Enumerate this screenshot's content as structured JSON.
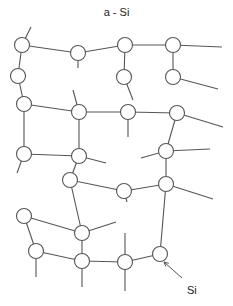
{
  "title": "a - Si",
  "annotation": {
    "label": "Si",
    "x": 187,
    "y": 284,
    "arrow_from": [
      182,
      278
    ],
    "arrow_to": [
      164,
      262
    ]
  },
  "style": {
    "stroke": "#555555",
    "node_fill": "#ffffff",
    "node_radius": 7.5
  },
  "nodes": [
    {
      "id": 1,
      "x": 22,
      "y": 45
    },
    {
      "id": 2,
      "x": 78,
      "y": 53
    },
    {
      "id": 3,
      "x": 125,
      "y": 45
    },
    {
      "id": 4,
      "x": 173,
      "y": 45
    },
    {
      "id": 5,
      "x": 18,
      "y": 76
    },
    {
      "id": 6,
      "x": 124,
      "y": 77
    },
    {
      "id": 7,
      "x": 173,
      "y": 77
    },
    {
      "id": 8,
      "x": 24,
      "y": 104
    },
    {
      "id": 9,
      "x": 79,
      "y": 112
    },
    {
      "id": 10,
      "x": 128,
      "y": 112
    },
    {
      "id": 11,
      "x": 177,
      "y": 113
    },
    {
      "id": 12,
      "x": 24,
      "y": 154
    },
    {
      "id": 13,
      "x": 79,
      "y": 156
    },
    {
      "id": 14,
      "x": 166,
      "y": 151
    },
    {
      "id": 15,
      "x": 70,
      "y": 180
    },
    {
      "id": 16,
      "x": 124,
      "y": 191
    },
    {
      "id": 17,
      "x": 166,
      "y": 184
    },
    {
      "id": 18,
      "x": 24,
      "y": 216
    },
    {
      "id": 19,
      "x": 82,
      "y": 233
    },
    {
      "id": 20,
      "x": 36,
      "y": 251
    },
    {
      "id": 21,
      "x": 82,
      "y": 261
    },
    {
      "id": 22,
      "x": 125,
      "y": 262
    },
    {
      "id": 23,
      "x": 160,
      "y": 254
    }
  ],
  "bonds": [
    [
      1,
      2
    ],
    [
      2,
      3
    ],
    [
      3,
      4
    ],
    [
      1,
      5
    ],
    [
      3,
      6
    ],
    [
      4,
      7
    ],
    [
      5,
      8
    ],
    [
      8,
      9
    ],
    [
      9,
      10
    ],
    [
      10,
      11
    ],
    [
      8,
      12
    ],
    [
      9,
      13
    ],
    [
      12,
      13
    ],
    [
      11,
      14
    ],
    [
      13,
      15
    ],
    [
      15,
      16
    ],
    [
      16,
      17
    ],
    [
      14,
      17
    ],
    [
      15,
      19
    ],
    [
      18,
      19
    ],
    [
      18,
      20
    ],
    [
      20,
      21
    ],
    [
      19,
      21
    ],
    [
      21,
      22
    ],
    [
      22,
      23
    ],
    [
      17,
      23
    ]
  ],
  "dangling": [
    [
      1,
      31,
      27
    ],
    [
      2,
      78,
      68
    ],
    [
      4,
      222,
      47
    ],
    [
      7,
      218,
      89
    ],
    [
      6,
      133,
      100
    ],
    [
      9,
      73,
      90
    ],
    [
      10,
      128,
      137
    ],
    [
      11,
      223,
      127
    ],
    [
      12,
      17,
      173
    ],
    [
      13,
      106,
      163
    ],
    [
      14,
      141,
      158
    ],
    [
      14,
      210,
      149
    ],
    [
      17,
      213,
      199
    ],
    [
      16,
      127,
      202
    ],
    [
      19,
      116,
      222
    ],
    [
      20,
      36,
      277
    ],
    [
      21,
      82,
      287
    ],
    [
      22,
      125,
      233
    ],
    [
      22,
      125,
      291
    ]
  ]
}
